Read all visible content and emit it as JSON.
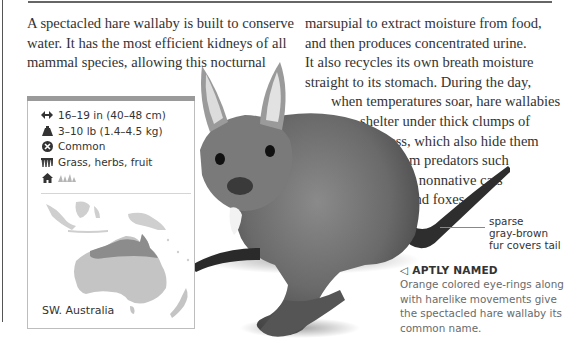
{
  "page": {
    "intro_left_lines": [
      "A spectacled hare wallaby is built to conserve",
      "water. It has the most efficient kidneys of all",
      "mammal species, allowing this nocturnal"
    ],
    "intro_right_lines": [
      {
        "text": "marsupial to extract moisture from food,",
        "indent": 0
      },
      {
        "text": "and then produces concentrated urine.",
        "indent": 0
      },
      {
        "text": "It also recycles its own breath moisture",
        "indent": 0
      },
      {
        "text": "straight to its stomach. During the day,",
        "indent": 0
      },
      {
        "text": "when temperatures soar, hare wallabies",
        "indent": 26
      },
      {
        "text": "shelter under thick clumps of",
        "indent": 55
      },
      {
        "text": "grass, which also hide them",
        "indent": 72
      },
      {
        "text": "from predators such",
        "indent": 87
      },
      {
        "text": "as nonnative cats",
        "indent": 98
      },
      {
        "text": "and foxes.",
        "indent": 103
      }
    ]
  },
  "fact_panel": {
    "stats": [
      {
        "icon": "length-arrows-icon",
        "text": "16–19 in (40–48 cm)"
      },
      {
        "icon": "weight-icon",
        "text": "3–10 lb (1.4–4.5 kg)"
      },
      {
        "icon": "status-circle-x-icon",
        "text": "Common"
      },
      {
        "icon": "diet-grass-icon",
        "text": "Grass, herbs, fruit"
      },
      {
        "icon": "habitat-house-icon",
        "text": ""
      }
    ],
    "habitat_icon": "grassland-icon",
    "map_label": "SW. Australia",
    "bar_color": "#9a9a9a",
    "range_color": "#8c8c8c",
    "land_color": "#c4c4c4"
  },
  "captions": {
    "tail_lines": [
      "sparse",
      "gray-brown",
      "fur covers tail"
    ],
    "aptly_marker": "◁",
    "aptly_title": "APTLY NAMED",
    "aptly_lines": [
      "Orange colored eye-rings along",
      "with harelike movements give",
      "the spectacled hare wallaby its",
      "common name."
    ]
  }
}
